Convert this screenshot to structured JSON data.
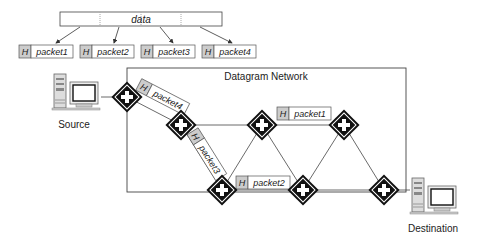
{
  "data_block": {
    "label": "data"
  },
  "packets": [
    {
      "header": "H",
      "label": "packet1"
    },
    {
      "header": "H",
      "label": "packet2"
    },
    {
      "header": "H",
      "label": "packet3"
    },
    {
      "header": "H",
      "label": "packet4"
    }
  ],
  "network": {
    "title": "Datagram Network"
  },
  "hosts": {
    "source": "Source",
    "destination": "Destination"
  },
  "in_transit": [
    {
      "header": "H",
      "label": "packet4"
    },
    {
      "header": "H",
      "label": "packet3"
    },
    {
      "header": "H",
      "label": "packet2"
    },
    {
      "header": "H",
      "label": "packet1"
    }
  ],
  "colors": {
    "line": "#333333",
    "header_fill": "#cccccc",
    "router": "#111111"
  }
}
